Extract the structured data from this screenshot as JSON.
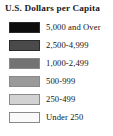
{
  "legend": {
    "title": "U.S. Dollars per Capita",
    "items": [
      {
        "label": "5,000 and Over",
        "color": "#0d0d0d"
      },
      {
        "label": "2,500-4,999",
        "color": "#4a4a4a"
      },
      {
        "label": "1,000-2,499",
        "color": "#737373"
      },
      {
        "label": "500-999",
        "color": "#9a9a9a"
      },
      {
        "label": "250-499",
        "color": "#d2d2d2"
      },
      {
        "label": "Under 250",
        "color": "#fafafa"
      }
    ]
  },
  "chart_data": {
    "type": "table",
    "title": "U.S. Dollars per Capita",
    "xlabel": "",
    "ylabel": "",
    "categories": [
      "5,000 and Over",
      "2,500-4,999",
      "1,000-2,499",
      "500-999",
      "250-499",
      "Under 250"
    ],
    "values": [
      {
        "class": "5,000 and Over",
        "min": 5000,
        "max": null,
        "color": "#0d0d0d"
      },
      {
        "class": "2,500-4,999",
        "min": 2500,
        "max": 4999,
        "color": "#4a4a4a"
      },
      {
        "class": "1,000-2,499",
        "min": 1000,
        "max": 2499,
        "color": "#737373"
      },
      {
        "class": "500-999",
        "min": 500,
        "max": 999,
        "color": "#9a9a9a"
      },
      {
        "class": "250-499",
        "min": 250,
        "max": 499,
        "color": "#d2d2d2"
      },
      {
        "class": "Under 250",
        "min": null,
        "max": 249,
        "color": "#fafafa"
      }
    ],
    "legend_position": "standalone",
    "grid": false
  }
}
